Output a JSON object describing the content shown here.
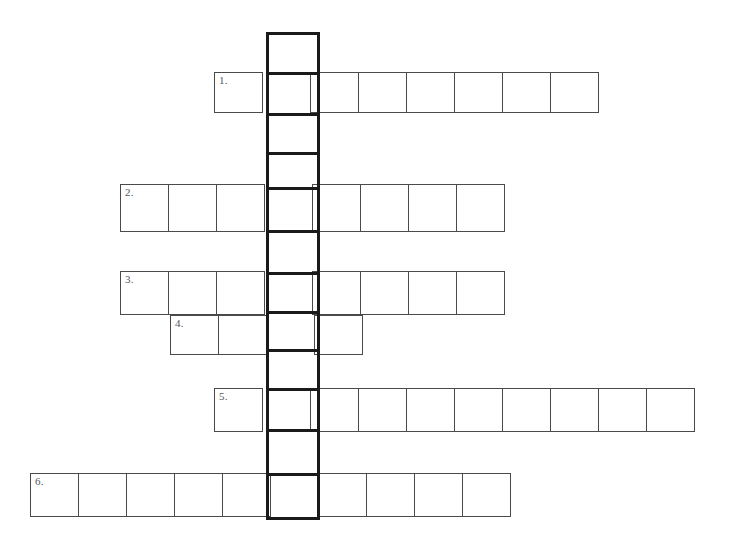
{
  "page": {
    "background_color": "#ffffff",
    "width": 736,
    "height": 539
  },
  "style": {
    "cell_border_color": "#4a4a4a",
    "key_column_border_color": "#1a1a1a",
    "number_color": "#55565a",
    "cell_fill": "#ffffff"
  },
  "key_column": {
    "name": "vertical-key-column",
    "x": 266,
    "y": 32,
    "cell_width": 54,
    "cell_count": 12,
    "cell_heights": [
      40,
      41,
      39,
      35,
      43,
      42,
      39,
      38,
      39,
      41,
      44,
      44
    ],
    "letters": [
      "",
      "",
      "",
      "",
      "",
      "",
      "",
      "",
      "",
      "",
      "",
      ""
    ]
  },
  "rows": [
    {
      "number": "1.",
      "name": "across-row-1",
      "x": 214,
      "y": 72,
      "cell_width": 49,
      "cell_height": 41,
      "cell_count": 8,
      "key_index": 1,
      "letters": [
        "",
        "",
        "",
        "",
        "",
        "",
        "",
        ""
      ]
    },
    {
      "number": "2.",
      "name": "across-row-2",
      "x": 120,
      "y": 184,
      "cell_width": 49,
      "cell_height": 48,
      "cell_count": 8,
      "key_index": 3,
      "letters": [
        "",
        "",
        "",
        "",
        "",
        "",
        "",
        ""
      ]
    },
    {
      "number": "3.",
      "name": "across-row-3",
      "x": 120,
      "y": 271,
      "cell_width": 49,
      "cell_height": 44,
      "cell_count": 8,
      "key_index": 3,
      "letters": [
        "",
        "",
        "",
        "",
        "",
        "",
        "",
        ""
      ]
    },
    {
      "number": "4.",
      "name": "across-row-4",
      "x": 170,
      "y": 315,
      "cell_width": 49,
      "cell_height": 40,
      "cell_count": 4,
      "key_index": 2,
      "letters": [
        "",
        "",
        "",
        ""
      ]
    },
    {
      "number": "5.",
      "name": "across-row-5",
      "x": 214,
      "y": 388,
      "cell_width": 49,
      "cell_height": 44,
      "cell_count": 10,
      "key_index": 1,
      "letters": [
        "",
        "",
        "",
        "",
        "",
        "",
        "",
        "",
        "",
        ""
      ]
    },
    {
      "number": "6.",
      "name": "across-row-6",
      "x": 30,
      "y": 473,
      "cell_width": 49,
      "cell_height": 44,
      "cell_count": 10,
      "key_index": 5,
      "letters": [
        "",
        "",
        "",
        "",
        "",
        "",
        "",
        "",
        "",
        ""
      ]
    }
  ]
}
